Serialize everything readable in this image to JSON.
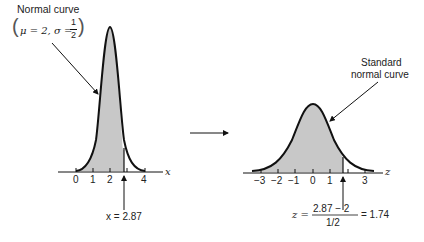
{
  "left": {
    "title": "Normal curve",
    "params_open": "(",
    "mu_text": "μ = 2, σ = ",
    "frac_num": "1",
    "frac_den": "2",
    "params_close": ")",
    "axis_var": "x",
    "ticks": [
      "0",
      "1",
      "2",
      "4"
    ],
    "marker_label": "x = 2.87"
  },
  "right": {
    "title_line1": "Standard",
    "title_line2": "normal curve",
    "axis_var": "z",
    "ticks": [
      "−3",
      "−2",
      "−1",
      "0",
      "1",
      "3"
    ],
    "formula_lhs": "z =",
    "formula_num": "2.87 − 2",
    "formula_den": "1/2",
    "formula_rhs": "= 1.74"
  },
  "colors": {
    "shade": "#c8c8c8",
    "ink": "#111111"
  }
}
